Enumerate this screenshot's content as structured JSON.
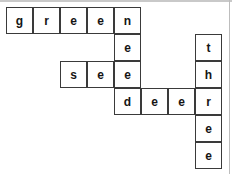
{
  "puzzle": {
    "type": "crossword-grid",
    "grid_origin": {
      "x": 6,
      "y": 7
    },
    "cell_size": 27,
    "columns": 8,
    "rows": 6,
    "background_color": "#ffffff",
    "cell_border_color": "#3a3a3a",
    "letter_color": "#151515",
    "edge_artifact_color": "#c9c9c9",
    "cells": [
      {
        "name": "cell-r0-c0",
        "row": 0,
        "col": 0,
        "letter": "g"
      },
      {
        "name": "cell-r0-c1",
        "row": 0,
        "col": 1,
        "letter": "r"
      },
      {
        "name": "cell-r0-c2",
        "row": 0,
        "col": 2,
        "letter": "e"
      },
      {
        "name": "cell-r0-c3",
        "row": 0,
        "col": 3,
        "letter": "e"
      },
      {
        "name": "cell-r0-c4",
        "row": 0,
        "col": 4,
        "letter": "n"
      },
      {
        "name": "cell-r1-c4",
        "row": 1,
        "col": 4,
        "letter": "e"
      },
      {
        "name": "cell-r1-c7",
        "row": 1,
        "col": 7,
        "letter": "t"
      },
      {
        "name": "cell-r2-c2",
        "row": 2,
        "col": 2,
        "letter": "s"
      },
      {
        "name": "cell-r2-c3",
        "row": 2,
        "col": 3,
        "letter": "e"
      },
      {
        "name": "cell-r2-c4",
        "row": 2,
        "col": 4,
        "letter": "e"
      },
      {
        "name": "cell-r2-c7",
        "row": 2,
        "col": 7,
        "letter": "h"
      },
      {
        "name": "cell-r3-c4",
        "row": 3,
        "col": 4,
        "letter": "d"
      },
      {
        "name": "cell-r3-c5",
        "row": 3,
        "col": 5,
        "letter": "e"
      },
      {
        "name": "cell-r3-c6",
        "row": 3,
        "col": 6,
        "letter": "e"
      },
      {
        "name": "cell-r3-c7",
        "row": 3,
        "col": 7,
        "letter": "r"
      },
      {
        "name": "cell-r4-c7",
        "row": 4,
        "col": 7,
        "letter": "e"
      },
      {
        "name": "cell-r5-c7",
        "row": 5,
        "col": 7,
        "letter": "e"
      }
    ],
    "words": [
      {
        "text": "green",
        "direction": "across",
        "row": 0,
        "col": 0
      },
      {
        "text": "see",
        "direction": "across",
        "row": 2,
        "col": 2
      },
      {
        "text": "deer",
        "direction": "across",
        "row": 3,
        "col": 4
      },
      {
        "text": "need",
        "direction": "down",
        "row": 0,
        "col": 4
      },
      {
        "text": "three",
        "direction": "down",
        "row": 1,
        "col": 7
      }
    ]
  }
}
